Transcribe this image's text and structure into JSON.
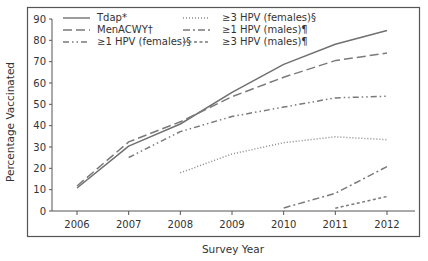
{
  "chart_data": {
    "type": "line",
    "title": "",
    "xlabel": "Survey Year",
    "ylabel": "Percentage Vaccinated",
    "x": [
      2006,
      2007,
      2008,
      2009,
      2010,
      2011,
      2012
    ],
    "xticks": [
      "2006",
      "2007",
      "2008",
      "2009",
      "2010",
      "2011",
      "2012"
    ],
    "yticks": [
      0,
      10,
      20,
      30,
      40,
      50,
      60,
      70,
      80,
      90
    ],
    "ylim": [
      0,
      90
    ],
    "grid": false,
    "legend_position": "top-left, two columns",
    "series": [
      {
        "name": "Tdap*",
        "style": "solid",
        "color": "#707070",
        "values": [
          10.8,
          30.4,
          40.8,
          55.6,
          68.7,
          78.2,
          84.6
        ]
      },
      {
        "name": "MenACWY†",
        "style": "long-dash",
        "color": "#7a7a7a",
        "values": [
          11.7,
          32.4,
          41.8,
          53.6,
          62.7,
          70.5,
          74.0
        ]
      },
      {
        "name": "≥1 HPV (females)§",
        "style": "dash-dot-dot",
        "color": "#7a7a7a",
        "values": [
          null,
          25.1,
          37.2,
          44.3,
          48.7,
          53.0,
          53.8
        ]
      },
      {
        "name": "≥3 HPV (females)§",
        "style": "dotted",
        "color": "#8a8a8a",
        "values": [
          null,
          null,
          17.9,
          26.7,
          32.0,
          34.8,
          33.4
        ]
      },
      {
        "name": "≥1 HPV (males)¶",
        "style": "dash-dot",
        "color": "#7a7a7a",
        "values": [
          null,
          null,
          null,
          null,
          1.4,
          8.3,
          20.8
        ]
      },
      {
        "name": "≥3 HPV (males)¶",
        "style": "short-dash",
        "color": "#7a7a7a",
        "values": [
          null,
          null,
          null,
          null,
          null,
          1.3,
          6.8
        ]
      }
    ]
  }
}
